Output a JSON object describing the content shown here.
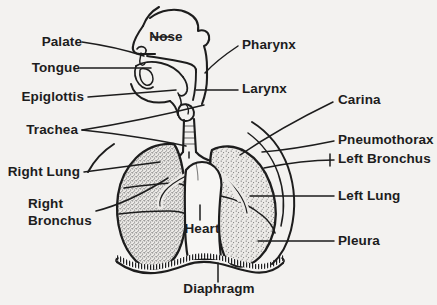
{
  "diagram": {
    "background_color": "#f3f2f0",
    "ink_color": "#1d1d1d",
    "lung_fill": "stipple-gray",
    "labels": {
      "palate": "Palate",
      "tongue": "Tongue",
      "epiglottis": "Epiglottis",
      "trachea": "Trachea",
      "right_lung": "Right Lung",
      "right_bronchus_line1": "Right",
      "right_bronchus_line2": "Bronchus",
      "nose": "Nose",
      "heart": "Heart",
      "diaphragm": "Diaphragm",
      "pharynx": "Pharynx",
      "larynx": "Larynx",
      "carina": "Carina",
      "pneumothorax": "Pneumothorax",
      "left_bronchus": "Left Bronchus",
      "left_lung": "Left Lung",
      "pleura": "Pleura"
    }
  }
}
